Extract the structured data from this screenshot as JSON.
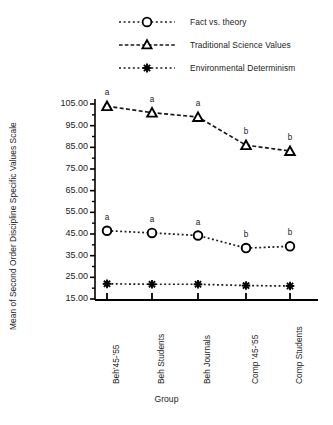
{
  "chart_data": {
    "type": "line",
    "title": "",
    "xlabel": "Group",
    "ylabel": "Mean of Second Order Discipline Specific Values Scale",
    "categories": [
      "Beh'45-'55",
      "Beh Students",
      "Beh Journals",
      "Comp '45-'55",
      "Comp Students"
    ],
    "ylim": [
      15.0,
      110.0
    ],
    "yticks": [
      15.0,
      25.0,
      35.0,
      45.0,
      55.0,
      65.0,
      75.0,
      85.0,
      95.0,
      105.0
    ],
    "ytick_labels": [
      "15.00",
      "25.00",
      "35.00",
      "45.00",
      "55.00",
      "65.00",
      "75.00",
      "85.00",
      "95.00",
      "105.00"
    ],
    "minor_ticks": true,
    "grid": false,
    "legend_position": "top",
    "series": [
      {
        "name": "Fact vs. theory",
        "marker": "circle",
        "linestyle": "dotted",
        "values": [
          46.5,
          45.5,
          44.3,
          38.5,
          39.3
        ],
        "annotations": [
          "a",
          "a",
          "a",
          "b",
          "b"
        ]
      },
      {
        "name": "Traditional Science Values",
        "marker": "triangle",
        "linestyle": "dashed",
        "values": [
          104.0,
          101.0,
          99.0,
          86.0,
          83.3
        ],
        "annotations": [
          "a",
          "a",
          "a",
          "b",
          "b"
        ]
      },
      {
        "name": "Environmental Determinism",
        "marker": "asterisk",
        "linestyle": "dotted",
        "values": [
          22.0,
          21.8,
          21.8,
          21.2,
          21.0
        ],
        "annotations": [
          "",
          "",
          "",
          "",
          ""
        ]
      }
    ]
  },
  "legend": {
    "items": [
      {
        "label": "Fact vs. theory",
        "marker": "circle-marker-icon"
      },
      {
        "label": "Traditional Science Values",
        "marker": "triangle-marker-icon"
      },
      {
        "label": "Environmental Determinism",
        "marker": "asterisk-marker-icon"
      }
    ]
  },
  "axes": {
    "y_title": "Mean of Second Order Discipline Specific Values Scale",
    "x_title": "Group"
  },
  "colors": {
    "ink": "#1a1a1a",
    "axis": "#000000",
    "background": "#ffffff"
  }
}
